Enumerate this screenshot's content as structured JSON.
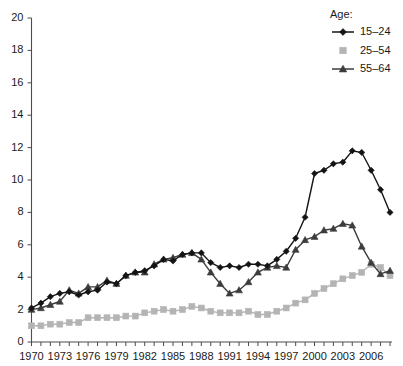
{
  "chart_data": {
    "type": "line",
    "title": "",
    "subtitle": "",
    "xlabel": "",
    "ylabel": "",
    "grid": false,
    "legend_position": "top-right",
    "legend_title": "Age:",
    "xlim": [
      1970,
      2008
    ],
    "ylim": [
      0,
      20
    ],
    "ytick_step": 2,
    "xtick_step": 1,
    "xtick_label_step": 3,
    "yticks": [
      0,
      2,
      4,
      6,
      8,
      10,
      12,
      14,
      16,
      18,
      20
    ],
    "ytick_labels": [
      "0",
      "2",
      "4",
      "6",
      "8",
      "10",
      "12",
      "14",
      "16",
      "18",
      "20"
    ],
    "x": [
      1970,
      1971,
      1972,
      1973,
      1974,
      1975,
      1976,
      1977,
      1978,
      1979,
      1980,
      1981,
      1982,
      1983,
      1984,
      1985,
      1986,
      1987,
      1988,
      1989,
      1990,
      1991,
      1992,
      1993,
      1994,
      1995,
      1996,
      1997,
      1998,
      1999,
      2000,
      2001,
      2002,
      2003,
      2004,
      2005,
      2006,
      2007,
      2008
    ],
    "xtick_labels": [
      "1970",
      "1973",
      "1976",
      "1979",
      "1982",
      "1985",
      "1988",
      "1991",
      "1994",
      "1997",
      "2000",
      "2003",
      "2006"
    ],
    "xtick_label_years": [
      1970,
      1973,
      1976,
      1979,
      1982,
      1985,
      1988,
      1991,
      1994,
      1997,
      2000,
      2003,
      2006
    ],
    "series": [
      {
        "name": "15–24",
        "marker": "diamond",
        "color": "#141414",
        "values": [
          2.1,
          2.4,
          2.8,
          3.0,
          3.1,
          2.9,
          3.1,
          3.2,
          3.7,
          3.6,
          4.1,
          4.3,
          4.4,
          4.7,
          5.1,
          5.0,
          5.4,
          5.5,
          5.5,
          4.9,
          4.6,
          4.7,
          4.6,
          4.8,
          4.8,
          4.7,
          5.1,
          5.6,
          6.4,
          7.7,
          10.4,
          10.6,
          11.0,
          11.1,
          11.8,
          11.7,
          10.6,
          9.4,
          8.0
        ]
      },
      {
        "name": "25–54",
        "marker": "square",
        "color": "#b4b4b4",
        "values": [
          1.0,
          1.0,
          1.1,
          1.1,
          1.2,
          1.2,
          1.5,
          1.5,
          1.5,
          1.5,
          1.6,
          1.6,
          1.8,
          1.9,
          2.0,
          1.9,
          2.0,
          2.2,
          2.1,
          1.9,
          1.8,
          1.8,
          1.8,
          1.9,
          1.7,
          1.7,
          1.9,
          2.1,
          2.4,
          2.6,
          3.0,
          3.3,
          3.6,
          3.9,
          4.1,
          4.3,
          4.8,
          4.6,
          4.1
        ]
      },
      {
        "name": "55–64",
        "marker": "triangle",
        "color": "#3c3c3c",
        "values": [
          2.0,
          2.1,
          2.3,
          2.5,
          3.2,
          3.0,
          3.4,
          3.4,
          3.8,
          3.6,
          4.1,
          4.3,
          4.3,
          4.8,
          5.1,
          5.2,
          5.4,
          5.5,
          5.1,
          4.3,
          3.6,
          3.0,
          3.2,
          3.7,
          4.3,
          4.6,
          4.7,
          4.6,
          5.7,
          6.3,
          6.5,
          6.9,
          7.0,
          7.3,
          7.2,
          5.9,
          4.9,
          4.2,
          4.4
        ]
      }
    ]
  }
}
